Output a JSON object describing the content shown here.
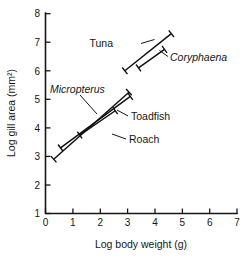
{
  "chart_data": {
    "type": "line",
    "title": "",
    "subtitle": "",
    "xlabel": "Log body weight (g)",
    "ylabel": "Log gill area (mm²)",
    "xlim": [
      0,
      7
    ],
    "ylim": [
      1,
      8
    ],
    "xticks": [
      "0",
      "1",
      "2",
      "3",
      "4",
      "5",
      "6",
      "7"
    ],
    "yticks": [
      "1",
      "2",
      "3",
      "4",
      "5",
      "6",
      "7",
      "8"
    ],
    "xtick_values": [
      0,
      1,
      2,
      3,
      4,
      5,
      6,
      7
    ],
    "ytick_values": [
      1,
      2,
      3,
      4,
      5,
      6,
      7,
      8
    ],
    "grid": false,
    "legend_position": "inline-annotations",
    "series": [
      {
        "name": "Tuna",
        "italic": false,
        "x": [
          2.9,
          4.6
        ],
        "y": [
          6.0,
          7.3
        ],
        "endpoint_caps": true
      },
      {
        "name": "Coryphaena",
        "italic": true,
        "x": [
          3.4,
          4.35
        ],
        "y": [
          6.1,
          6.75
        ],
        "endpoint_caps": true
      },
      {
        "name": "Micropterus",
        "italic": true,
        "x": [
          0.3,
          3.05
        ],
        "y": [
          2.9,
          5.25
        ],
        "endpoint_caps": true
      },
      {
        "name": "Toadfish",
        "italic": false,
        "x": [
          0.55,
          3.1
        ],
        "y": [
          3.3,
          5.1
        ],
        "endpoint_caps": true
      },
      {
        "name": "Roach",
        "italic": false,
        "x": [
          1.25,
          2.55
        ],
        "y": [
          3.75,
          4.6
        ],
        "endpoint_caps": true
      }
    ],
    "annotations": [
      {
        "text": "Tuna",
        "italic": false
      },
      {
        "text": "Coryphaena",
        "italic": true
      },
      {
        "text": "Micropterus",
        "italic": true
      },
      {
        "text": "Toadfish",
        "italic": false
      },
      {
        "text": "Roach",
        "italic": false
      }
    ]
  }
}
